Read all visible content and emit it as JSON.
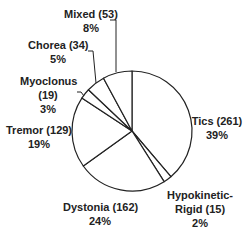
{
  "chart_data": {
    "type": "pie",
    "title": "",
    "start_angle_deg": 0,
    "direction": "clockwise",
    "slices": [
      {
        "label": "Tics",
        "count": 261,
        "percent": 39
      },
      {
        "label": "Hypokinetic-Rigid",
        "count": 15,
        "percent": 2
      },
      {
        "label": "Dystonia",
        "count": 162,
        "percent": 24
      },
      {
        "label": "Tremor",
        "count": 129,
        "percent": 19
      },
      {
        "label": "Myoclonus",
        "count": 19,
        "percent": 3
      },
      {
        "label": "Chorea",
        "count": 34,
        "percent": 5
      },
      {
        "label": "Mixed",
        "count": 53,
        "percent": 8
      }
    ],
    "fill": "#ffffff",
    "stroke": "#222222",
    "legend": "none"
  },
  "labels": {
    "tics": {
      "line1": "Tics (261)",
      "line2": "39%"
    },
    "hypo": {
      "line1": "Hypokinetic-",
      "line2": "Rigid (15)",
      "line3": "2%"
    },
    "dystonia": {
      "line1": "Dystonia (162)",
      "line2": "24%"
    },
    "tremor": {
      "line1": "Tremor (129)",
      "line2": "19%"
    },
    "myoclonus": {
      "line1": "Myoclonus",
      "line2": "(19)",
      "line3": "3%"
    },
    "chorea": {
      "line1": "Chorea (34)",
      "line2": "5%"
    },
    "mixed": {
      "line1": "Mixed (53)",
      "line2": "8%"
    }
  }
}
